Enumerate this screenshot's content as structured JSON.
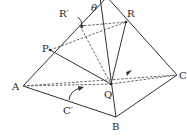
{
  "diagram": {
    "labels": {
      "theta": "θ",
      "R_prime": "R′",
      "R": "R",
      "P": "P",
      "A": "A",
      "Q": "Q",
      "C": "C",
      "C_prime": "C′",
      "B": "B"
    },
    "colors": {
      "line": "#333333",
      "dashed": "#555555",
      "background": "#ffffff"
    }
  }
}
